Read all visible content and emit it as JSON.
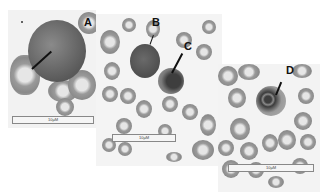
{
  "figure": {
    "panels": [
      {
        "id": "A",
        "label": "A",
        "scale_bar": "10µM"
      },
      {
        "id": "BC",
        "labels": [
          "B",
          "C"
        ],
        "label_b": "B",
        "label_c": "C",
        "scale_bar": "10µM"
      },
      {
        "id": "D",
        "label": "D",
        "scale_bar": "10µM"
      }
    ]
  },
  "colors": {
    "background": "#ffffff",
    "cells": "#8a8a8a",
    "nucleus": "#505050"
  }
}
